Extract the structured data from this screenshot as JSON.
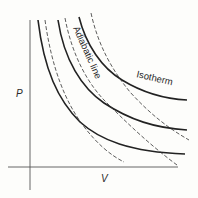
{
  "diagram": {
    "title": "",
    "axes": {
      "x_label": "V",
      "y_label": "P"
    },
    "labels": {
      "adiabatic": "Adiabatic line",
      "isotherm": "Isotherm"
    },
    "colors": {
      "background": "#fdfdfb",
      "ink": "#2a2a2a",
      "axis": "#555555"
    },
    "isotherms": [
      {
        "name": "isotherm-1",
        "style": "solid",
        "path": "M38,20 C44,70 58,100 80,122 C100,140 130,152 185,154"
      },
      {
        "name": "isotherm-2",
        "style": "solid",
        "path": "M58,20 C64,60 82,88 104,103 C130,120 155,128 187,130"
      },
      {
        "name": "isotherm-3",
        "style": "solid",
        "path": "M79,17 C86,45 102,68 122,80 C145,94 165,99 187,100"
      }
    ],
    "adiabats": [
      {
        "name": "adiabatic-1",
        "style": "dashed",
        "path": "M45,20 C52,70 66,102 82,124 C96,143 110,155 124,162"
      },
      {
        "name": "adiabatic-2",
        "style": "dashed",
        "path": "M65,18 C72,55 88,85 108,104 C128,124 150,145 177,165"
      },
      {
        "name": "adiabatic-3",
        "style": "dashed",
        "path": "M91,13 C98,45 112,70 130,92 C150,114 168,128 189,140"
      }
    ]
  }
}
